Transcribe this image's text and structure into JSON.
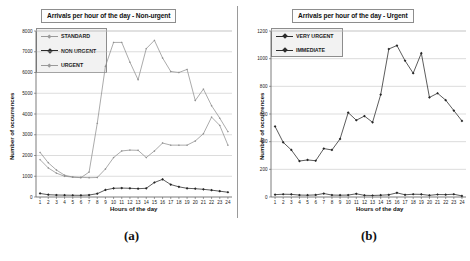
{
  "figure": {
    "panels": [
      {
        "caption": "(a)",
        "title": "Arrivals per hour of the day - Non-urgent"
      },
      {
        "caption": "(b)",
        "title": "Arrivals per hour of the day - Urgent"
      }
    ]
  },
  "chart_data": [
    {
      "type": "line",
      "title": "Arrivals per hour of the day - Non-urgent",
      "xlabel": "Hours of the day",
      "ylabel": "Number of occurrences",
      "panel_caption": "(a)",
      "categories": [
        1,
        2,
        3,
        4,
        5,
        6,
        7,
        8,
        9,
        10,
        11,
        12,
        13,
        14,
        15,
        16,
        17,
        18,
        19,
        20,
        21,
        22,
        23,
        24
      ],
      "x": [
        1,
        2,
        3,
        4,
        5,
        6,
        7,
        8,
        9,
        10,
        11,
        12,
        13,
        14,
        15,
        16,
        17,
        18,
        19,
        20,
        21,
        22,
        23,
        24
      ],
      "ylim": [
        0,
        8000
      ],
      "yticks": [
        0,
        1000,
        2000,
        3000,
        4000,
        5000,
        6000,
        7000,
        8000
      ],
      "ytick_labels": [
        "0",
        "1000",
        "2000",
        "3000",
        "4000",
        "5000",
        "6000",
        "7000",
        "8000"
      ],
      "xticks": [
        1,
        2,
        3,
        4,
        5,
        6,
        7,
        8,
        9,
        10,
        11,
        12,
        13,
        14,
        15,
        16,
        17,
        18,
        19,
        20,
        21,
        22,
        23,
        24
      ],
      "grid": true,
      "legend_position": "top-left",
      "series": [
        {
          "name": "STANDARD",
          "color": "#8f8f8f",
          "values": [
            2150,
            1650,
            1300,
            1050,
            960,
            930,
            1200,
            3550,
            6300,
            7450,
            7450,
            6500,
            5650,
            7150,
            7550,
            6700,
            6050,
            6000,
            6150,
            4650,
            5200,
            4400,
            3800,
            3150
          ]
        },
        {
          "name": "NON URGENT",
          "color": "#262626",
          "values": [
            170,
            110,
            95,
            90,
            85,
            80,
            95,
            160,
            340,
            420,
            430,
            420,
            400,
            420,
            700,
            850,
            600,
            490,
            420,
            400,
            370,
            330,
            280,
            230
          ]
        },
        {
          "name": "URGENT",
          "color": "#8f8f8f",
          "values": [
            1800,
            1400,
            1150,
            1000,
            960,
            950,
            930,
            940,
            1350,
            1900,
            2220,
            2260,
            2250,
            1900,
            2220,
            2600,
            2500,
            2500,
            2500,
            2700,
            3050,
            3850,
            3450,
            2500
          ]
        }
      ]
    },
    {
      "type": "line",
      "title": "Arrivals per hour of the day - Urgent",
      "xlabel": "Hours of the day",
      "ylabel": "Number of occurrences",
      "panel_caption": "(b)",
      "categories": [
        1,
        2,
        3,
        4,
        5,
        6,
        7,
        8,
        9,
        10,
        11,
        12,
        13,
        14,
        15,
        16,
        17,
        18,
        19,
        20,
        21,
        22,
        23,
        24
      ],
      "x": [
        1,
        2,
        3,
        4,
        5,
        6,
        7,
        8,
        9,
        10,
        11,
        12,
        13,
        14,
        15,
        16,
        17,
        18,
        19,
        20,
        21,
        22,
        23,
        24
      ],
      "ylim": [
        0,
        1200
      ],
      "yticks": [
        0,
        200,
        400,
        600,
        800,
        1000,
        1200
      ],
      "ytick_labels": [
        "0",
        "200",
        "400",
        "600",
        "800",
        "1000",
        "1200"
      ],
      "xticks": [
        1,
        2,
        3,
        4,
        5,
        6,
        7,
        8,
        9,
        10,
        11,
        12,
        13,
        14,
        15,
        16,
        17,
        18,
        19,
        20,
        21,
        22,
        23,
        24
      ],
      "grid": true,
      "legend_position": "top-left",
      "series": [
        {
          "name": "VERY URGENT",
          "color": "#262626",
          "values": [
            510,
            395,
            340,
            260,
            268,
            262,
            350,
            340,
            420,
            610,
            555,
            585,
            540,
            740,
            1070,
            1095,
            985,
            895,
            1040,
            720,
            750,
            700,
            625,
            550
          ]
        },
        {
          "name": "IMMEDIATE",
          "color": "#262626",
          "values": [
            17,
            20,
            19,
            14,
            13,
            15,
            25,
            14,
            13,
            14,
            23,
            12,
            11,
            13,
            16,
            30,
            16,
            20,
            19,
            12,
            18,
            17,
            20,
            8
          ]
        }
      ]
    }
  ]
}
